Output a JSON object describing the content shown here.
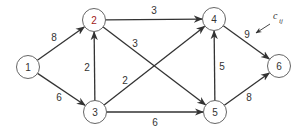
{
  "diagram": {
    "type": "directed weighted graph",
    "nodes": [
      {
        "id": "1",
        "label": "1",
        "x": 28,
        "y": 67
      },
      {
        "id": "2",
        "label": "2",
        "x": 94,
        "y": 20
      },
      {
        "id": "3",
        "label": "3",
        "x": 95,
        "y": 112
      },
      {
        "id": "4",
        "label": "4",
        "x": 214,
        "y": 19
      },
      {
        "id": "5",
        "label": "5",
        "x": 215,
        "y": 112
      },
      {
        "id": "6",
        "label": "6",
        "x": 279,
        "y": 66
      }
    ],
    "edges": [
      {
        "from": "1",
        "to": "2",
        "weight": "8",
        "lx": 54,
        "ly": 37
      },
      {
        "from": "1",
        "to": "3",
        "weight": "6",
        "lx": 59,
        "ly": 97
      },
      {
        "from": "3",
        "to": "2",
        "weight": "2",
        "lx": 87,
        "ly": 67
      },
      {
        "from": "2",
        "to": "4",
        "weight": "3",
        "lx": 154,
        "ly": 10
      },
      {
        "from": "2",
        "to": "5",
        "weight": "3",
        "lx": 135,
        "ly": 43
      },
      {
        "from": "3",
        "to": "4",
        "weight": "2",
        "lx": 125,
        "ly": 80
      },
      {
        "from": "3",
        "to": "5",
        "weight": "6",
        "lx": 155,
        "ly": 122
      },
      {
        "from": "5",
        "to": "4",
        "weight": "5",
        "lx": 222,
        "ly": 66
      },
      {
        "from": "4",
        "to": "6",
        "weight": "9",
        "lx": 247,
        "ly": 34
      },
      {
        "from": "5",
        "to": "6",
        "weight": "8",
        "lx": 249,
        "ly": 97
      }
    ],
    "annotation": {
      "text": "c",
      "subscript": "ij",
      "x": 273,
      "y": 19,
      "points_to": "4->6 weight label"
    }
  }
}
